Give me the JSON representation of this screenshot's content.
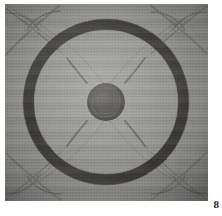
{
  "page": {
    "folio": "8",
    "background_color": "#ffffff"
  },
  "plate": {
    "caption": "",
    "media": "halftone photographic plate",
    "field_color": "#8b8b8b",
    "ink_color": "#32302e",
    "highlight_color": "#b4b2ae",
    "subject": "circular metal shield with central boss, broad dark rim and crossed-sword corner ornaments"
  },
  "artwork": {
    "outer_ring": {
      "label": "outer rim band",
      "center_x": 101,
      "center_y": 98,
      "outer_radius": 83,
      "inner_radius": 72,
      "color": "#36332f"
    },
    "field": {
      "label": "shield face",
      "color": "#8c8c8a"
    },
    "boss": {
      "label": "central boss",
      "center_x": 101,
      "center_y": 98,
      "radius": 19,
      "color": "#3c3a37"
    },
    "spokes": {
      "label": "radiating engraved spokes",
      "count": 4,
      "angles_deg": [
        45,
        135,
        225,
        315
      ],
      "inner_radius": 27,
      "outer_radius": 63,
      "color": "#5f5d59"
    },
    "corner_ornaments": {
      "label": "crossed scimitar corner ornaments",
      "count": 4,
      "positions": [
        "top-left",
        "top-right",
        "bottom-left",
        "bottom-right"
      ],
      "color": "#7a7873"
    }
  }
}
